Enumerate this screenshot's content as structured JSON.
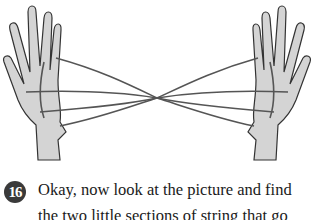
{
  "illustration": {
    "description": "Two hands holding a string figure (cat's cradle) stretched between them, strings crossing in the middle"
  },
  "step": {
    "number": "16",
    "line1": "Okay, now look at the picture and find",
    "line2": "the two little sections of string that go"
  }
}
